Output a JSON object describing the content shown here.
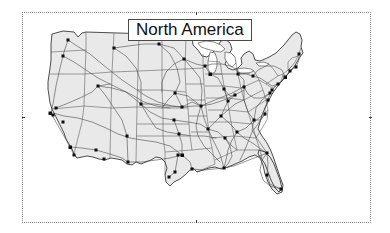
{
  "figure": {
    "title": "North America",
    "frame": {
      "style": "dotted-border",
      "border_color": "#8a8a8a",
      "background": "#ffffff",
      "has_center_ticks": true
    }
  },
  "map": {
    "name": "united-states-map",
    "region_label": "North America",
    "land_fill_color": "#e9e9e9",
    "outline_color": "#2e2e2e",
    "state_boundary_color": "#555555",
    "highway_color": "#4a4a4a",
    "city_marker_color": "#0d0d0d",
    "city_marker_shape": "square",
    "layers": [
      "country-outline",
      "state-boundaries",
      "interstate-highways",
      "city-markers"
    ],
    "city_count": 53,
    "cities": [
      {
        "name": "Seattle",
        "x": 46,
        "y": 28
      },
      {
        "name": "Portland",
        "x": 41,
        "y": 44
      },
      {
        "name": "Sacramento",
        "x": 34,
        "y": 96
      },
      {
        "name": "San Francisco",
        "x": 28,
        "y": 101
      },
      {
        "name": "Oakland",
        "x": 31,
        "y": 103
      },
      {
        "name": "Fresno",
        "x": 41,
        "y": 110
      },
      {
        "name": "Los Angeles",
        "x": 48,
        "y": 135
      },
      {
        "name": "San Diego",
        "x": 52,
        "y": 143
      },
      {
        "name": "Phoenix",
        "x": 74,
        "y": 138
      },
      {
        "name": "Tucson",
        "x": 82,
        "y": 147
      },
      {
        "name": "Salt Lake City",
        "x": 76,
        "y": 74
      },
      {
        "name": "Denver",
        "x": 119,
        "y": 92
      },
      {
        "name": "Albuquerque",
        "x": 105,
        "y": 124
      },
      {
        "name": "El Paso",
        "x": 106,
        "y": 150
      },
      {
        "name": "Billings",
        "x": 92,
        "y": 36
      },
      {
        "name": "Bismarck",
        "x": 137,
        "y": 32
      },
      {
        "name": "Minneapolis",
        "x": 162,
        "y": 47
      },
      {
        "name": "Omaha",
        "x": 153,
        "y": 81
      },
      {
        "name": "Kansas City",
        "x": 160,
        "y": 95
      },
      {
        "name": "Wichita",
        "x": 152,
        "y": 108
      },
      {
        "name": "Oklahoma City",
        "x": 157,
        "y": 122
      },
      {
        "name": "Dallas",
        "x": 160,
        "y": 143
      },
      {
        "name": "Fort Worth",
        "x": 156,
        "y": 143
      },
      {
        "name": "Austin",
        "x": 153,
        "y": 160
      },
      {
        "name": "San Antonio",
        "x": 147,
        "y": 165
      },
      {
        "name": "Houston",
        "x": 170,
        "y": 157
      },
      {
        "name": "New Orleans",
        "x": 202,
        "y": 156
      },
      {
        "name": "Memphis",
        "x": 186,
        "y": 117
      },
      {
        "name": "St. Louis",
        "x": 179,
        "y": 94
      },
      {
        "name": "Chicago",
        "x": 188,
        "y": 62
      },
      {
        "name": "Milwaukee",
        "x": 183,
        "y": 54
      },
      {
        "name": "Indianapolis",
        "x": 202,
        "y": 77
      },
      {
        "name": "Detroit",
        "x": 216,
        "y": 62
      },
      {
        "name": "Cleveland",
        "x": 231,
        "y": 64
      },
      {
        "name": "Columbus",
        "x": 222,
        "y": 75
      },
      {
        "name": "Cincinnati",
        "x": 213,
        "y": 83
      },
      {
        "name": "Louisville",
        "x": 206,
        "y": 89
      },
      {
        "name": "Nashville",
        "x": 199,
        "y": 104
      },
      {
        "name": "Birmingham",
        "x": 203,
        "y": 126
      },
      {
        "name": "Atlanta",
        "x": 215,
        "y": 120
      },
      {
        "name": "Jacksonville",
        "x": 245,
        "y": 141
      },
      {
        "name": "Tampa",
        "x": 245,
        "y": 163
      },
      {
        "name": "Miami",
        "x": 259,
        "y": 177
      },
      {
        "name": "Charlotte",
        "x": 232,
        "y": 108
      },
      {
        "name": "Raleigh",
        "x": 243,
        "y": 102
      },
      {
        "name": "Richmond",
        "x": 246,
        "y": 88
      },
      {
        "name": "Washington DC",
        "x": 248,
        "y": 81
      },
      {
        "name": "Baltimore",
        "x": 250,
        "y": 78
      },
      {
        "name": "Philadelphia",
        "x": 256,
        "y": 72
      },
      {
        "name": "New York",
        "x": 263,
        "y": 65
      },
      {
        "name": "Hartford",
        "x": 268,
        "y": 59
      },
      {
        "name": "Boston",
        "x": 274,
        "y": 55
      },
      {
        "name": "Portland ME",
        "x": 277,
        "y": 42
      }
    ]
  }
}
